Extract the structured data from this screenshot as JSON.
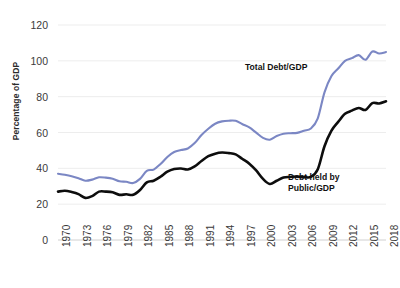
{
  "chart_data": {
    "type": "line",
    "title": "",
    "xlabel": "",
    "ylabel": "Percentage of GDP",
    "ylim": [
      0,
      120
    ],
    "ytick_values": [
      0,
      20,
      40,
      60,
      80,
      100,
      120
    ],
    "grid": true,
    "legend_position": "inline-annotation",
    "x": [
      1970,
      1971,
      1972,
      1973,
      1974,
      1975,
      1976,
      1977,
      1978,
      1979,
      1980,
      1981,
      1982,
      1983,
      1984,
      1985,
      1986,
      1987,
      1988,
      1989,
      1990,
      1991,
      1992,
      1993,
      1994,
      1995,
      1996,
      1997,
      1998,
      1999,
      2000,
      2001,
      2002,
      2003,
      2004,
      2005,
      2006,
      2007,
      2008,
      2009,
      2010,
      2011,
      2012,
      2013,
      2014,
      2015,
      2016,
      2017,
      2018
    ],
    "xtick_labels": [
      "1970",
      "1973",
      "1976",
      "1979",
      "1982",
      "1985",
      "1988",
      "1991",
      "1994",
      "1997",
      "2000",
      "2003",
      "2006",
      "2009",
      "2012",
      "2015",
      "2018"
    ],
    "series": [
      {
        "name": "Total Debt/GDP",
        "color": "#7b87c4",
        "values": [
          37.0,
          36.4,
          35.6,
          34.5,
          33.1,
          33.7,
          35.0,
          34.8,
          34.2,
          32.8,
          32.5,
          31.8,
          34.1,
          38.6,
          39.3,
          42.4,
          46.3,
          49.1,
          50.2,
          51.1,
          54.1,
          58.6,
          62.1,
          64.9,
          66.2,
          66.6,
          66.5,
          64.6,
          62.8,
          59.9,
          57.0,
          56.0,
          58.0,
          59.3,
          59.6,
          59.8,
          61.0,
          62.2,
          67.7,
          82.4,
          91.4,
          95.7,
          100.0,
          101.5,
          103.2,
          100.6,
          105.2,
          104.1,
          104.9
        ]
      },
      {
        "name": "Debt held by Public/GDP",
        "color": "#0d0d0d",
        "values": [
          27.0,
          27.5,
          26.8,
          25.6,
          23.5,
          24.5,
          27.0,
          27.0,
          26.6,
          25.2,
          25.5,
          25.2,
          27.9,
          32.2,
          33.1,
          35.3,
          38.1,
          39.6,
          39.9,
          39.4,
          41.1,
          44.1,
          46.8,
          48.2,
          48.8,
          48.5,
          47.8,
          45.2,
          42.6,
          38.8,
          34.1,
          31.3,
          33.1,
          34.9,
          35.2,
          35.4,
          35.1,
          35.2,
          39.3,
          52.3,
          60.9,
          65.9,
          70.4,
          72.2,
          73.7,
          72.6,
          76.4,
          76.2,
          77.4
        ]
      }
    ],
    "annotations": [
      {
        "name": "total-debt-label",
        "text": "Total Debt/GDP"
      },
      {
        "name": "public-debt-label",
        "text": "Debt held by\nPublic/GDP"
      }
    ]
  }
}
